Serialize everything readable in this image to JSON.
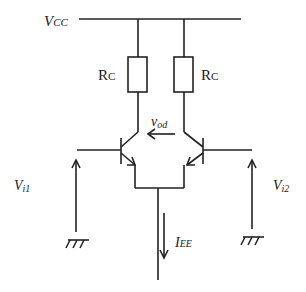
{
  "diagram": {
    "type": "differential-amplifier-circuit",
    "labels": {
      "supply": "V",
      "supply_sub": "CC",
      "resistor_left": "R",
      "resistor_left_sub": "C",
      "resistor_right": "R",
      "resistor_right_sub": "C",
      "output_voltage": "v",
      "output_voltage_sub": "od",
      "input_left": "V",
      "input_left_sub": "i1",
      "input_right": "V",
      "input_right_sub": "i2",
      "tail_current": "I",
      "tail_current_sub": "EE"
    },
    "components": [
      {
        "id": "RC-left",
        "kind": "resistor"
      },
      {
        "id": "RC-right",
        "kind": "resistor"
      },
      {
        "id": "Q1",
        "kind": "npn-transistor"
      },
      {
        "id": "Q2",
        "kind": "npn-transistor"
      },
      {
        "id": "GND-left",
        "kind": "ground"
      },
      {
        "id": "GND-right",
        "kind": "ground"
      }
    ]
  }
}
